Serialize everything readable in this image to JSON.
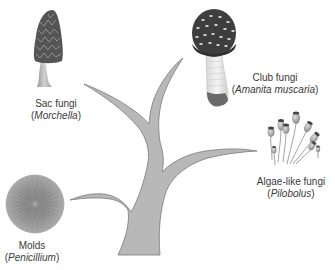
{
  "diagram": {
    "type": "phylogenetic-tree",
    "colors": {
      "background": "#ffffff",
      "tree_fill": "#b8b8b8",
      "tree_stroke": "#7a7a7a",
      "label_text": "#3a3a3a"
    },
    "groups": [
      {
        "id": "sac-fungi",
        "common_name": "Sac fungi",
        "genus": "Morchella",
        "icon": "morel-mushroom-icon"
      },
      {
        "id": "club-fungi",
        "common_name": "Club fungi",
        "genus": "Amanita muscaria",
        "icon": "amanita-mushroom-icon"
      },
      {
        "id": "algae-like-fungi",
        "common_name": "Algae-like fungi",
        "genus": "Pilobolus",
        "icon": "pilobolus-sporangia-icon"
      },
      {
        "id": "molds",
        "common_name": "Molds",
        "genus": "Penicillium",
        "icon": "penicillium-colony-icon"
      }
    ]
  }
}
